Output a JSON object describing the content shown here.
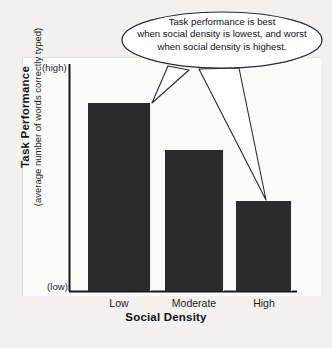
{
  "chart_data": {
    "type": "bar",
    "title": "",
    "subtitle": "",
    "xlabel": "Social Density",
    "ylabel": "Task Performance",
    "ylabel_sub": "(average number of words correctly typed)",
    "categories": [
      "Low",
      "Moderate",
      "High"
    ],
    "values": [
      100,
      75,
      48
    ],
    "ylim": [
      0,
      110
    ],
    "y_axis_ticks": [
      "(low)",
      "(high)"
    ],
    "y_axis_top_label": "(high)",
    "y_axis_bottom_label": "(low)",
    "grid": false,
    "legend": null,
    "bar_color": "#2b2b2b",
    "background_color": "#f2f1ef",
    "annotations": [
      {
        "id": "callout",
        "shape": "ellipse-speech-bubble",
        "lines": [
          "Task performance is best",
          "when social density is lowest, and worst",
          "when social density is highest."
        ],
        "points_to": [
          "Low",
          "High"
        ]
      }
    ]
  },
  "axis": {
    "high_label": "(high)",
    "low_label": "(low)"
  },
  "labels": {
    "y_title": "Task Performance",
    "y_subtitle": "(average number of words correctly typed)",
    "x_title": "Social Density"
  },
  "categories": [
    {
      "label": "Low"
    },
    {
      "label": "Moderate"
    },
    {
      "label": "High"
    }
  ],
  "callout": {
    "line1": "Task performance is best",
    "line2": "when social density is lowest, and worst",
    "line3": "when social density is highest."
  },
  "colors": {
    "bar": "#2b2b2b",
    "background": "#f2f1ef",
    "axis": "#161616",
    "callout_fill": "#ffffff",
    "callout_stroke": "#2a2a2a"
  }
}
